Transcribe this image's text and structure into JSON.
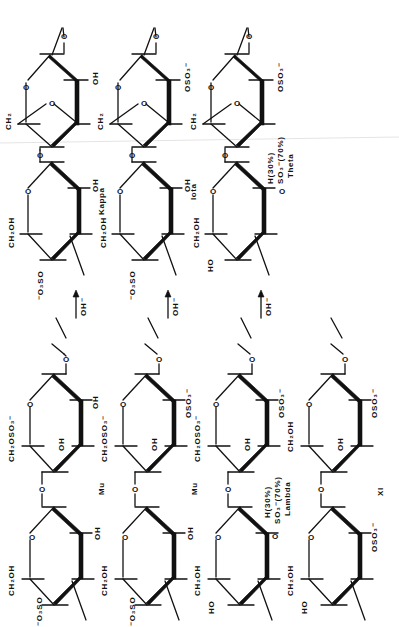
{
  "figure": {
    "orientation": "rotated-90-ccw",
    "ink_color": "#111111",
    "background": "#ffffff"
  },
  "top_panel": {
    "columns": [
      {
        "name": "Kappa",
        "upper_unit": {
          "type": "3,6-anhydro",
          "substituent_2": "OH",
          "ring_atom": "O",
          "ch2": "CH2",
          "anhydro_o": "O"
        },
        "lower_unit": {
          "c6": "CH2OH",
          "c4": "-O3SO",
          "c2": "OH"
        },
        "reagent": "OH-"
      },
      {
        "name": "Iota",
        "upper_unit": {
          "type": "3,6-anhydro",
          "substituent_2": "OSO3-",
          "ring_atom": "O",
          "ch2": "CH2",
          "anhydro_o": "O"
        },
        "lower_unit": {
          "c6": "CH2OH",
          "c4": "-O3SO",
          "c2": "OH"
        },
        "reagent": "OH-"
      },
      {
        "name": "Theta",
        "upper_unit": {
          "type": "3,6-anhydro",
          "substituent_2": "OSO3-",
          "ring_atom": "O",
          "ch2": "CH2",
          "anhydro_o": "O"
        },
        "lower_unit": {
          "c6": "CH2OH",
          "c4": "HO",
          "c2_line1": "H(30%)",
          "c2_line2": "SO3-(70%)",
          "c2_o": "O"
        },
        "reagent": "OH-"
      }
    ]
  },
  "bottom_panel": {
    "columns": [
      {
        "name": "Mu",
        "upper_unit": {
          "c6": "CH2OSO3-",
          "c3": "OH",
          "c2": "OH"
        },
        "lower_unit": {
          "c6": "CH2OH",
          "c4": "-O3SO",
          "c2": "OH"
        }
      },
      {
        "name": "Nu",
        "upper_unit": {
          "c6": "CH2OSO3-",
          "c3": "OH",
          "c2": "OSO3-"
        },
        "lower_unit": {
          "c6": "CH2OH",
          "c4": "-O3SO",
          "c2": "OH"
        }
      },
      {
        "name": "Lambda",
        "upper_unit": {
          "c6": "CH2OSO3-",
          "c3": "OH",
          "c2": "OSO3-"
        },
        "lower_unit": {
          "c6": "CH2OH",
          "c4": "HO",
          "c2_line1": "H(30%)",
          "c2_line2": "SO3-(70%)",
          "c2_o": "O"
        }
      },
      {
        "name": "XI",
        "upper_unit": {
          "c6": "CH2OH",
          "c3": "OH",
          "c2": "OSO3-"
        },
        "lower_unit": {
          "c6": "CH2OH",
          "c4": "HO",
          "c2": "OSO3-"
        }
      }
    ]
  },
  "labels": {
    "ring_o": "O",
    "glyco_o": "O",
    "kappa": "Kappa",
    "iota": "Iota",
    "theta": "Theta",
    "mu": "Mu",
    "nu": "Nu",
    "lambda": "Lambda",
    "xi": "XI",
    "oh_minus": "OH⁻",
    "oh": "OH",
    "ho": "HO",
    "ch2": "CH₂",
    "ch2oh": "CH₂OH",
    "ch2oso3": "CH₂OSO₃⁻",
    "o3so": "⁻O₃SO",
    "oso3": "OSO₃⁻",
    "h30": "H(30%)",
    "so3_70": "SO₃⁻(70%)"
  }
}
